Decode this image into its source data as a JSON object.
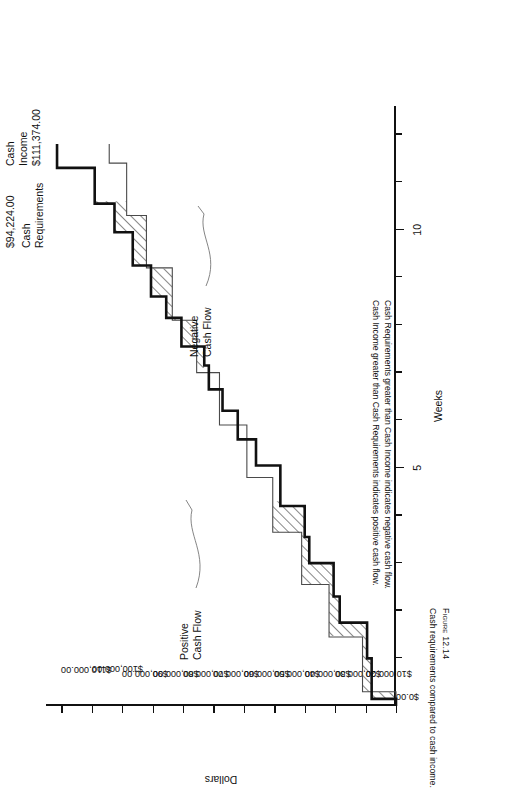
{
  "figure": {
    "number_label": "Figure 12.14",
    "caption": "Cash requirements compared to cash income."
  },
  "notes": {
    "line1": "Cash Requirements greater than Cash Income indicates negative cash flow.",
    "line2": "Cash Income greater than Cash Requirements indicates positive cash flow."
  },
  "value_labels": {
    "cash_income_name": "Cash\nIncome",
    "cash_income_value": "$111,374.00",
    "cash_requirements_value": "$94,224.00",
    "cash_requirements_name": "Cash\nRequirements"
  },
  "annotations": {
    "positive": "Positive\nCash Flow",
    "negative": "Negative\nCash Flow"
  },
  "chart_data": {
    "type": "line",
    "title": "",
    "xlabel": "Weeks",
    "ylabel": "Dollars",
    "xlim": [
      0,
      12.6
    ],
    "ylim": [
      0,
      115000
    ],
    "grid": false,
    "legend": "inline-labels",
    "xticks": [
      1,
      2,
      3,
      4,
      5,
      6,
      7,
      8,
      9,
      10,
      11,
      12
    ],
    "xtick_labels": {
      "5": "5",
      "10": "10"
    },
    "yticks": [
      0,
      10000,
      20000,
      30000,
      40000,
      50000,
      60000,
      70000,
      80000,
      90000,
      100000,
      110000
    ],
    "ytick_labels": [
      "$0.00",
      "$10,000.00",
      "$20,000.00",
      "$30,000.00",
      "$40,000.00",
      "$50,000.00",
      "$60,000.00",
      "$70,000.00",
      "$80,000.00",
      "$90,000.00",
      "$100,000.00",
      "$110,000.00"
    ],
    "series": [
      {
        "name": "Cash Income",
        "style": "thick-step",
        "final_value": 111374.0,
        "x": [
          0.0,
          0.15,
          0.15,
          1.0,
          1.0,
          1.75,
          1.75,
          2.3,
          2.3,
          3.0,
          3.0,
          3.55,
          3.55,
          4.2,
          4.2,
          5.05,
          5.05,
          5.6,
          5.6,
          6.2,
          6.2,
          6.65,
          6.65,
          7.15,
          7.15,
          7.55,
          7.55,
          8.15,
          8.15,
          8.6,
          8.6,
          9.25,
          9.25,
          9.95,
          9.95,
          10.55,
          10.55,
          11.3,
          11.3,
          11.8
        ],
        "y": [
          0,
          0,
          8000,
          8000,
          9500,
          9500,
          18500,
          18500,
          20500,
          20500,
          28500,
          28500,
          30000,
          30000,
          38000,
          38000,
          46000,
          46000,
          52000,
          52000,
          57000,
          57000,
          61500,
          61500,
          63000,
          63000,
          70500,
          70500,
          75500,
          75500,
          80500,
          80500,
          86500,
          86500,
          92500,
          92500,
          99000,
          99000,
          111374,
          111374
        ]
      },
      {
        "name": "Cash Requirements",
        "style": "thin-step",
        "final_value": 94224.0,
        "x": [
          0.0,
          0.3,
          0.3,
          1.45,
          1.45,
          2.55,
          2.55,
          3.65,
          3.65,
          4.8,
          4.8,
          5.9,
          5.9,
          7.0,
          7.0,
          8.1,
          8.1,
          9.2,
          9.2,
          10.3,
          10.3,
          11.4,
          11.4,
          11.8
        ],
        "y": [
          0,
          0,
          11000,
          11000,
          22000,
          22000,
          31000,
          31000,
          40500,
          40500,
          49000,
          49000,
          58000,
          58000,
          65500,
          65500,
          73500,
          73500,
          82000,
          82000,
          88500,
          88500,
          94224,
          94224
        ]
      }
    ],
    "shaded_regions": [
      {
        "label": "Negative Cash Flow",
        "meaning": "Cash Requirements above Cash Income",
        "hatch": "diagonal",
        "x_range": [
          0.15,
          4.3
        ]
      },
      {
        "label": "Positive Cash Flow",
        "meaning": "Cash Income above Cash Requirements",
        "hatch": "diagonal",
        "x_range": [
          7.1,
          10.6
        ]
      }
    ]
  }
}
